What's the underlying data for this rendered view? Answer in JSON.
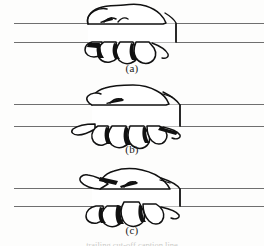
{
  "figure": {
    "background_color": "#fdfdfc",
    "ink_color": "#111111",
    "bar_line_color": "#6f6f6f",
    "shadow_fill": "#000000",
    "skin_fill": "#ffffff",
    "caption_bottom": "trailing cut-off caption line",
    "panels": [
      {
        "id": "panel-a",
        "label": "(a)",
        "subject": "hand gripping horizontal bar",
        "bar_top_y": 23,
        "bar_bottom_y": 42,
        "cuff_right_x": 176,
        "thumb_position": "over-top-of-bar",
        "fingers_visible": 4
      },
      {
        "id": "panel-b",
        "label": "(b)",
        "subject": "hand gripping horizontal bar",
        "bar_top_y": 104,
        "bar_bottom_y": 126,
        "cuff_right_x": 180,
        "thumb_position": "extended-left-below-bar",
        "fingers_visible": 4
      },
      {
        "id": "panel-c",
        "label": "(c)",
        "subject": "hand gripping horizontal bar",
        "bar_top_y": 188,
        "bar_bottom_y": 206,
        "cuff_right_x": 180,
        "thumb_position": "extended-left-above-bar",
        "fingers_visible": 4
      }
    ]
  }
}
